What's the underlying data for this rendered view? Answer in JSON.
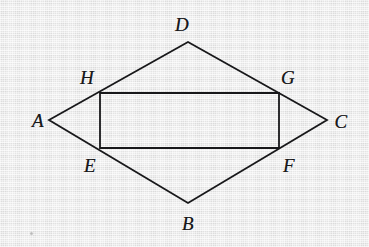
{
  "figure": {
    "kind": "geometry-diagram",
    "background_color": "#ebebeb",
    "stroke_color": "#18181a",
    "stroke_width": 1.8,
    "width": 369,
    "height": 247,
    "outer_shape": {
      "name": "rhombus-ADCB",
      "vertex_order": "A,D,C,B",
      "path": "M 49 120 L 188 42 L 327 120 L 188 203 Z"
    },
    "inner_shape": {
      "name": "rectangle-HGFE",
      "vertex_order": "H,G,F,E",
      "path": "M 100 93 L 279 93 L 279 148 L 100 148 Z"
    },
    "vertices": [
      {
        "id": "A",
        "label": "A",
        "role": "rhombus-left-apex",
        "x": 49,
        "y": 120,
        "label_x": 38,
        "label_y": 120
      },
      {
        "id": "B",
        "label": "B",
        "role": "rhombus-bottom-apex",
        "x": 188,
        "y": 203,
        "label_x": 188,
        "label_y": 223
      },
      {
        "id": "C",
        "label": "C",
        "role": "rhombus-right-apex",
        "x": 327,
        "y": 120,
        "label_x": 341,
        "label_y": 121
      },
      {
        "id": "D",
        "label": "D",
        "role": "rhombus-top-apex",
        "x": 188,
        "y": 42,
        "label_x": 182,
        "label_y": 24
      },
      {
        "id": "E",
        "label": "E",
        "role": "rectangle-bottom-left",
        "x": 100,
        "y": 148,
        "label_x": 90,
        "label_y": 165
      },
      {
        "id": "F",
        "label": "F",
        "role": "rectangle-bottom-right",
        "x": 279,
        "y": 148,
        "label_x": 289,
        "label_y": 165
      },
      {
        "id": "G",
        "label": "G",
        "role": "rectangle-top-right",
        "x": 279,
        "y": 93,
        "label_x": 288,
        "label_y": 77
      },
      {
        "id": "H",
        "label": "H",
        "role": "rectangle-top-left",
        "x": 100,
        "y": 93,
        "label_x": 87,
        "label_y": 77
      }
    ],
    "edges": [
      {
        "id": "AD",
        "from": "A",
        "to": "D",
        "x1": 49,
        "y1": 120,
        "x2": 188,
        "y2": 42
      },
      {
        "id": "DC",
        "from": "D",
        "to": "C",
        "x1": 188,
        "y1": 42,
        "x2": 327,
        "y2": 120
      },
      {
        "id": "CB",
        "from": "C",
        "to": "B",
        "x1": 327,
        "y1": 120,
        "x2": 188,
        "y2": 203
      },
      {
        "id": "BA",
        "from": "B",
        "to": "A",
        "x1": 188,
        "y1": 203,
        "x2": 49,
        "y2": 120
      },
      {
        "id": "HG",
        "from": "H",
        "to": "G",
        "x1": 100,
        "y1": 93,
        "x2": 279,
        "y2": 93
      },
      {
        "id": "GF",
        "from": "G",
        "to": "F",
        "x1": 279,
        "y1": 93,
        "x2": 279,
        "y2": 148
      },
      {
        "id": "FE",
        "from": "F",
        "to": "E",
        "x1": 279,
        "y1": 148,
        "x2": 100,
        "y2": 148
      },
      {
        "id": "EH",
        "from": "E",
        "to": "H",
        "x1": 100,
        "y1": 148,
        "x2": 100,
        "y2": 93
      }
    ],
    "specks": [
      {
        "x": 30,
        "y": 232
      }
    ]
  }
}
